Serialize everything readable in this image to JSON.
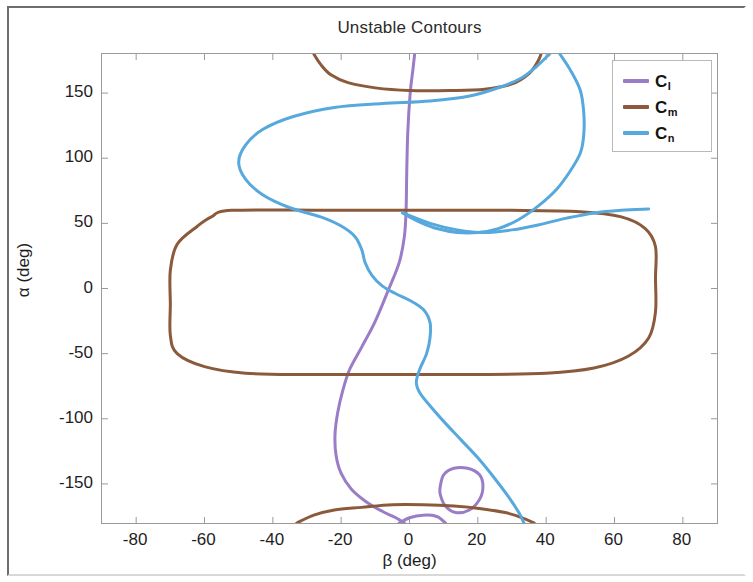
{
  "figure": {
    "title": "Unstable Contours",
    "xlabel": "β (deg)",
    "ylabel": "α (deg)"
  },
  "legend": {
    "items": [
      {
        "base": "C",
        "sub": "l",
        "color": "#9b7cc6",
        "name": "C_l"
      },
      {
        "base": "C",
        "sub": "m",
        "color": "#8a5a3b",
        "name": "C_m"
      },
      {
        "base": "C",
        "sub": "n",
        "color": "#56a8dd",
        "name": "C_n"
      }
    ]
  },
  "axes": {
    "xticks": [
      "-80",
      "-60",
      "-40",
      "-20",
      "0",
      "20",
      "40",
      "60",
      "80"
    ],
    "xtick_values": [
      -80,
      -60,
      -40,
      -20,
      0,
      20,
      40,
      60,
      80
    ],
    "yticks": [
      "150",
      "100",
      "50",
      "0",
      "-50",
      "-100",
      "-150"
    ],
    "ytick_values": [
      150,
      100,
      50,
      0,
      -50,
      -100,
      -150
    ]
  },
  "chart_data": {
    "type": "line",
    "title": "Unstable Contours",
    "xlabel": "β (deg)",
    "ylabel": "α (deg)",
    "xlim": [
      -90,
      90
    ],
    "ylim": [
      -180,
      180
    ],
    "grid": false,
    "legend_position": "top-right",
    "xticks": [
      -80,
      -60,
      -40,
      -20,
      0,
      20,
      40,
      60,
      80
    ],
    "yticks": [
      -150,
      -100,
      -50,
      0,
      50,
      100,
      150
    ],
    "series": [
      {
        "name": "C_l",
        "color": "#9b7cc6",
        "closed": false,
        "description": "Near-vertical sinuous contour entering top boundary near beta = 0, bulging left to about beta = -22 near alpha = -110, exiting bottom boundary near beta = 2",
        "points": [
          [
            1.5,
            180
          ],
          [
            1.0,
            168
          ],
          [
            0.2,
            150
          ],
          [
            -0.5,
            120
          ],
          [
            -0.8,
            90
          ],
          [
            -1.0,
            60
          ],
          [
            -1.5,
            40
          ],
          [
            -3.0,
            20
          ],
          [
            -6.0,
            0
          ],
          [
            -10.0,
            -25
          ],
          [
            -14.0,
            -45
          ],
          [
            -17.5,
            -62
          ],
          [
            -19.5,
            -78
          ],
          [
            -21.0,
            -95
          ],
          [
            -21.8,
            -112
          ],
          [
            -21.5,
            -128
          ],
          [
            -20.0,
            -142
          ],
          [
            -17.0,
            -154
          ],
          [
            -12.5,
            -164
          ],
          [
            -8.0,
            -171
          ],
          [
            -4.0,
            -176
          ],
          [
            -1.5,
            -180
          ]
        ]
      },
      {
        "name": "C_l_loop",
        "color": "#9b7cc6",
        "closed": true,
        "description": "Small closed purple loop near beta = 15, alpha = -152",
        "points": [
          [
            9.0,
            -152
          ],
          [
            10.0,
            -143
          ],
          [
            13.0,
            -138
          ],
          [
            17.0,
            -138
          ],
          [
            20.5,
            -143
          ],
          [
            21.5,
            -152
          ],
          [
            20.5,
            -162
          ],
          [
            17.5,
            -170
          ],
          [
            13.5,
            -172
          ],
          [
            10.5,
            -167
          ],
          [
            9.0,
            -158
          ]
        ]
      },
      {
        "name": "C_l_bottom_arc",
        "color": "#9b7cc6",
        "closed": false,
        "description": "Short purple arc along lower boundary between beta -3 and beta 10",
        "points": [
          [
            -3.0,
            -180
          ],
          [
            0.0,
            -176
          ],
          [
            4.0,
            -174
          ],
          [
            8.0,
            -175
          ],
          [
            10.5,
            -180
          ]
        ]
      },
      {
        "name": "C_m_main",
        "color": "#8a5a3b",
        "closed": true,
        "description": "Large closed rounded-rectangular contour spanning beta -70 to 72, alpha -65 to 60",
        "points": [
          [
            -52,
            60
          ],
          [
            -24,
            60
          ],
          [
            4,
            60
          ],
          [
            30,
            60
          ],
          [
            50,
            59
          ],
          [
            62,
            55
          ],
          [
            69,
            46
          ],
          [
            72,
            32
          ],
          [
            72,
            8
          ],
          [
            72,
            -18
          ],
          [
            70,
            -38
          ],
          [
            64,
            -52
          ],
          [
            54,
            -61
          ],
          [
            40,
            -65
          ],
          [
            20,
            -66
          ],
          [
            -6,
            -66
          ],
          [
            -30,
            -66
          ],
          [
            -48,
            -65
          ],
          [
            -60,
            -60
          ],
          [
            -68,
            -50
          ],
          [
            -70,
            -36
          ],
          [
            -70,
            -12
          ],
          [
            -70,
            14
          ],
          [
            -68,
            34
          ],
          [
            -62,
            48
          ],
          [
            -58,
            55
          ]
        ]
      },
      {
        "name": "C_m_top",
        "color": "#8a5a3b",
        "closed": false,
        "description": "Brown arc near top, dipping to alpha about 152 at center, rising to top boundary at beta -28 and beta 38",
        "points": [
          [
            -28,
            180
          ],
          [
            -26,
            172
          ],
          [
            -23,
            164
          ],
          [
            -18,
            158
          ],
          [
            -10,
            154
          ],
          [
            0,
            152
          ],
          [
            12,
            152
          ],
          [
            22,
            153
          ],
          [
            30,
            157
          ],
          [
            35,
            165
          ],
          [
            37.5,
            174
          ],
          [
            38.5,
            180
          ]
        ]
      },
      {
        "name": "C_m_bottom",
        "color": "#8a5a3b",
        "closed": false,
        "description": "Brown arc near bottom boundary peaking near alpha -167 around beta 0, from beta -33 to beta 37",
        "points": [
          [
            -33,
            -180
          ],
          [
            -28,
            -174
          ],
          [
            -22,
            -170
          ],
          [
            -14,
            -168
          ],
          [
            -5,
            -166
          ],
          [
            4,
            -166
          ],
          [
            13,
            -167
          ],
          [
            21,
            -169
          ],
          [
            28,
            -172
          ],
          [
            33,
            -176
          ],
          [
            36.5,
            -180
          ]
        ]
      },
      {
        "name": "C_n",
        "color": "#56a8dd",
        "closed": false,
        "description": "Large blue S-shaped contour from top boundary near beta 41, looping left to beta -50 around alpha 100, down through origin region, bulging right to beta 51 near alpha 100 on the right branch, then down and exiting bottom near beta 33",
        "points": [
          [
            41,
            180
          ],
          [
            37,
            170
          ],
          [
            33,
            162
          ],
          [
            27,
            155
          ],
          [
            18,
            148
          ],
          [
            6,
            144
          ],
          [
            -8,
            142
          ],
          [
            -22,
            139
          ],
          [
            -34,
            132
          ],
          [
            -43,
            122
          ],
          [
            -48,
            110
          ],
          [
            -50,
            97
          ],
          [
            -48,
            84
          ],
          [
            -43,
            72
          ],
          [
            -35,
            62
          ],
          [
            -26,
            55
          ],
          [
            -20,
            48
          ],
          [
            -16,
            40
          ],
          [
            -14,
            30
          ],
          [
            -13,
            20
          ],
          [
            -11,
            10
          ],
          [
            -8,
            2
          ],
          [
            -4,
            -4
          ],
          [
            0,
            -9
          ],
          [
            4,
            -16
          ],
          [
            6,
            -26
          ],
          [
            6,
            -38
          ],
          [
            5,
            -50
          ],
          [
            3,
            -62
          ],
          [
            2,
            -72
          ],
          [
            3,
            -80
          ],
          [
            6,
            -90
          ],
          [
            10,
            -102
          ],
          [
            15,
            -116
          ],
          [
            20,
            -130
          ],
          [
            25,
            -146
          ],
          [
            29,
            -160
          ],
          [
            32,
            -172
          ],
          [
            33.5,
            -180
          ]
        ]
      },
      {
        "name": "C_n_right",
        "color": "#56a8dd",
        "closed": false,
        "description": "Right blue branch from top boundary near beta 44 curving right to beta 51 near alpha 100 then back left to beta 22 near alpha 43 and out to the right boundary region near alpha 55",
        "points": [
          [
            44,
            180
          ],
          [
            47,
            168
          ],
          [
            50,
            152
          ],
          [
            51,
            135
          ],
          [
            51,
            118
          ],
          [
            50,
            104
          ],
          [
            47,
            90
          ],
          [
            43,
            76
          ],
          [
            38,
            64
          ],
          [
            32,
            53
          ],
          [
            26,
            46
          ],
          [
            20,
            43
          ],
          [
            14,
            43
          ],
          [
            8,
            46
          ],
          [
            3,
            51
          ],
          [
            0,
            55
          ],
          [
            -2,
            58
          ]
        ]
      },
      {
        "name": "C_n_right_tail",
        "color": "#56a8dd",
        "closed": false,
        "description": "Blue segment continuing right from alpha about 55 toward beta 72 near alpha 60",
        "points": [
          [
            -2,
            58
          ],
          [
            6,
            50
          ],
          [
            14,
            45
          ],
          [
            22,
            43
          ],
          [
            30,
            45
          ],
          [
            38,
            49
          ],
          [
            46,
            54
          ],
          [
            54,
            58
          ],
          [
            62,
            60
          ],
          [
            70,
            61
          ]
        ]
      }
    ]
  }
}
